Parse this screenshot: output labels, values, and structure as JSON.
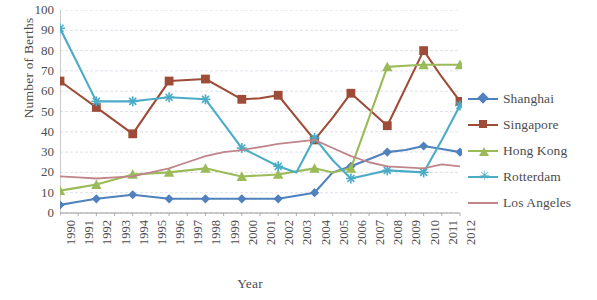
{
  "chart_data": {
    "type": "line",
    "title": "",
    "xlabel": "Year",
    "ylabel": "Number of Berths",
    "ylim": [
      0,
      100
    ],
    "ytick_step": 10,
    "yticks": [
      100,
      90,
      80,
      70,
      60,
      50,
      40,
      30,
      20,
      10,
      0
    ],
    "grid": true,
    "legend_position": "right",
    "categories": [
      "1990",
      "1991",
      "1992",
      "1993",
      "1994",
      "1995",
      "1996",
      "1997",
      "1998",
      "1999",
      "2000",
      "2001",
      "2002",
      "2003",
      "2004",
      "2005",
      "2006",
      "2007",
      "2008",
      "2009",
      "2010",
      "2011",
      "2012"
    ],
    "marker_years": [
      "1990",
      "1992",
      "1994",
      "1996",
      "1998",
      "2000",
      "2002",
      "2004",
      "2006",
      "2008",
      "2010",
      "2012"
    ],
    "series": [
      {
        "name": "Shanghai",
        "color": "#4f81bd",
        "marker": "diamond",
        "values": [
          4,
          5.5,
          7,
          8,
          9,
          8,
          7,
          7,
          7,
          7,
          7,
          7,
          7,
          8.5,
          10,
          20,
          23,
          26.5,
          30,
          31,
          33,
          31.5,
          30
        ]
      },
      {
        "name": "Singapore",
        "color": "#9e4b38",
        "marker": "square",
        "values": [
          65,
          58.5,
          52,
          45.5,
          39,
          52,
          65,
          65.5,
          66,
          61,
          56,
          56.5,
          58,
          47,
          36,
          47,
          59,
          51,
          43,
          61.5,
          80,
          67,
          55
        ]
      },
      {
        "name": "Hong Kong",
        "color": "#9bbb59",
        "marker": "triangle",
        "values": [
          11,
          12.5,
          14,
          16.5,
          19,
          19.5,
          20,
          21,
          22,
          20,
          18,
          18.5,
          19,
          20.5,
          22,
          20,
          22,
          47,
          72,
          72.5,
          73,
          73,
          73
        ]
      },
      {
        "name": "Rotterdam",
        "color": "#4bacc6",
        "marker": "star",
        "values": [
          91,
          73,
          55,
          55,
          55,
          56,
          57,
          56.5,
          56,
          44,
          32,
          27.5,
          23,
          20,
          37,
          26,
          17,
          19,
          21,
          20.5,
          20,
          36,
          53
        ]
      },
      {
        "name": "Los Angeles",
        "color": "#c0848a",
        "marker": "none",
        "values": [
          18,
          17.5,
          17,
          17.5,
          18,
          20,
          22,
          25,
          28,
          30,
          31,
          32.5,
          34,
          35,
          36,
          32,
          28,
          25,
          23,
          22.5,
          22,
          24,
          23
        ]
      }
    ]
  },
  "legend": {
    "items": [
      {
        "label": "Shanghai"
      },
      {
        "label": "Singapore"
      },
      {
        "label": "Hong Kong"
      },
      {
        "label": "Rotterdam"
      },
      {
        "label": "Los Angeles"
      }
    ]
  }
}
